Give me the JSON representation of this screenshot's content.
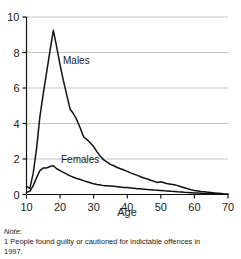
{
  "chart_data": {
    "type": "line",
    "title": "",
    "xlabel": "Age",
    "ylabel": "",
    "xlim": [
      10,
      70
    ],
    "ylim": [
      0,
      10
    ],
    "xticks": [
      10,
      20,
      30,
      40,
      50,
      60,
      70
    ],
    "yticks": [
      0,
      2,
      4,
      6,
      8,
      10
    ],
    "grid": "horizontal",
    "legend": "inline-annotations",
    "annotations": [
      {
        "text": "Males",
        "x": 22.5,
        "y": 7.0
      },
      {
        "text": "Females",
        "x": 25.5,
        "y": 1.65
      }
    ],
    "series": [
      {
        "name": "Males",
        "color": "#111111",
        "x": [
          10,
          11,
          12,
          13,
          14,
          15,
          16,
          17,
          18,
          19,
          20,
          21,
          22,
          23,
          24,
          25,
          26,
          27,
          28,
          29,
          30,
          31,
          32,
          33,
          34,
          35,
          36,
          37,
          38,
          39,
          40,
          41,
          42,
          43,
          44,
          45,
          46,
          47,
          48,
          49,
          50,
          51,
          52,
          53,
          54,
          55,
          56,
          57,
          58,
          59,
          60,
          61,
          62,
          63,
          64,
          65,
          66,
          67,
          68,
          69,
          70
        ],
        "values": [
          0.45,
          0.35,
          1.2,
          2.6,
          4.4,
          5.7,
          6.9,
          8.1,
          9.25,
          8.3,
          7.3,
          6.4,
          5.6,
          4.8,
          4.55,
          4.2,
          3.75,
          3.25,
          3.1,
          2.9,
          2.7,
          2.4,
          2.15,
          1.95,
          1.82,
          1.7,
          1.62,
          1.52,
          1.45,
          1.38,
          1.3,
          1.22,
          1.15,
          1.08,
          1.0,
          0.93,
          0.87,
          0.8,
          0.74,
          0.68,
          0.72,
          0.66,
          0.6,
          0.58,
          0.55,
          0.5,
          0.44,
          0.38,
          0.32,
          0.27,
          0.23,
          0.2,
          0.17,
          0.15,
          0.13,
          0.11,
          0.09,
          0.07,
          0.05,
          0.03,
          0.02
        ]
      },
      {
        "name": "Females",
        "color": "#111111",
        "x": [
          10,
          11,
          12,
          13,
          14,
          15,
          16,
          17,
          18,
          19,
          20,
          21,
          22,
          23,
          24,
          25,
          26,
          27,
          28,
          29,
          30,
          31,
          32,
          33,
          34,
          35,
          36,
          37,
          38,
          39,
          40,
          41,
          42,
          43,
          44,
          45,
          46,
          47,
          48,
          49,
          50,
          51,
          52,
          53,
          54,
          55,
          56,
          57,
          58,
          59,
          60,
          61,
          62,
          63,
          64,
          65,
          66,
          67,
          68,
          69,
          70
        ],
        "values": [
          0.12,
          0.18,
          0.5,
          0.95,
          1.35,
          1.5,
          1.5,
          1.58,
          1.62,
          1.45,
          1.35,
          1.25,
          1.15,
          1.05,
          0.97,
          0.9,
          0.84,
          0.78,
          0.72,
          0.66,
          0.6,
          0.56,
          0.53,
          0.5,
          0.5,
          0.48,
          0.46,
          0.44,
          0.42,
          0.4,
          0.39,
          0.37,
          0.35,
          0.33,
          0.32,
          0.3,
          0.28,
          0.27,
          0.25,
          0.24,
          0.23,
          0.21,
          0.2,
          0.18,
          0.17,
          0.15,
          0.14,
          0.12,
          0.11,
          0.1,
          0.09,
          0.08,
          0.07,
          0.06,
          0.05,
          0.05,
          0.04,
          0.03,
          0.03,
          0.02,
          0.02
        ]
      }
    ]
  },
  "axis": {
    "x_title": "Age",
    "x_tick_labels": [
      "10",
      "20",
      "30",
      "40",
      "50",
      "60",
      "70"
    ],
    "y_tick_labels": [
      "0",
      "2",
      "4",
      "6",
      "8",
      "10"
    ]
  },
  "series_labels": {
    "males": "Males",
    "females": "Females"
  },
  "note": {
    "heading": "Note:",
    "body": "1 People found guilty or cautioned for indictable offences in 1997."
  },
  "colors": {
    "line": "#111111",
    "grid": "#b4b4b4",
    "axis": "#111111",
    "text": "#1a1a1a",
    "background": "#ffffff"
  }
}
